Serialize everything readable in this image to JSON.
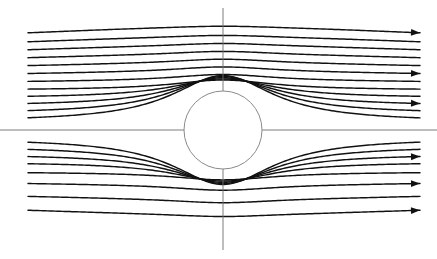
{
  "figure": {
    "kind": "streamline-diagram",
    "width": 437,
    "height": 259,
    "background_color": "#ffffff"
  },
  "colors": {
    "streamline": "#111111",
    "axis": "#6e6e6e",
    "cylinder_stroke": "#8a8a8a",
    "cylinder_fill": "#ffffff",
    "arrow": "#111111"
  },
  "cylinder": {
    "label": "cylinder",
    "center_x": 223,
    "center_y": 130,
    "radius": 39
  },
  "axes": {
    "vertical": {
      "label": "y-axis",
      "x": 223,
      "y_start": 8,
      "y_end": 250
    },
    "horizontal": {
      "label": "x-axis",
      "y": 130,
      "x_start": 0,
      "x_end": 437
    }
  },
  "flow": {
    "direction": "left-to-right",
    "inlet_x": 28,
    "outlet_x": 420,
    "streamline_count": 20
  },
  "chart_data": {
    "type": "line",
    "xlabel": "",
    "ylabel": "",
    "xlim": [
      0,
      437
    ],
    "ylim": [
      0,
      259
    ],
    "grid": false,
    "legend": "none",
    "cylinder": {
      "cx": 223,
      "cy": 130,
      "r": 39
    },
    "note": "psi values are signed offsets in pixels from the horizontal centerline at the far field; negative = above axis, positive = below axis",
    "series": [
      {
        "name": "streamline-01",
        "psi": -97,
        "inlet_y": 33,
        "outlet_y": 34,
        "arrow": true
      },
      {
        "name": "streamline-02",
        "psi": -88,
        "inlet_y": 42,
        "outlet_y": 43,
        "arrow": false
      },
      {
        "name": "streamline-03",
        "psi": -80,
        "inlet_y": 50,
        "outlet_y": 51,
        "arrow": false
      },
      {
        "name": "streamline-04",
        "psi": -72,
        "inlet_y": 58,
        "outlet_y": 59,
        "arrow": false
      },
      {
        "name": "streamline-05",
        "psi": -64,
        "inlet_y": 66,
        "outlet_y": 67,
        "arrow": false
      },
      {
        "name": "streamline-06",
        "psi": -56,
        "inlet_y": 74,
        "outlet_y": 75,
        "arrow": true
      },
      {
        "name": "streamline-07",
        "psi": -48,
        "inlet_y": 82,
        "outlet_y": 83,
        "arrow": false
      },
      {
        "name": "streamline-08",
        "psi": -40,
        "inlet_y": 90,
        "outlet_y": 91,
        "arrow": false
      },
      {
        "name": "streamline-09",
        "psi": -32,
        "inlet_y": 98,
        "outlet_y": 99,
        "arrow": false
      },
      {
        "name": "streamline-10",
        "psi": -24,
        "inlet_y": 106,
        "outlet_y": 107,
        "arrow": true
      },
      {
        "name": "streamline-11",
        "psi": -16,
        "inlet_y": 114,
        "outlet_y": 115,
        "arrow": false
      },
      {
        "name": "streamline-12",
        "psi": -8,
        "inlet_y": 122,
        "outlet_y": 123,
        "arrow": false
      },
      {
        "name": "streamline-13",
        "psi": 8,
        "inlet_y": 138,
        "outlet_y": 139,
        "arrow": false
      },
      {
        "name": "streamline-14",
        "psi": 16,
        "inlet_y": 146,
        "outlet_y": 147,
        "arrow": false
      },
      {
        "name": "streamline-15",
        "psi": 24,
        "inlet_y": 154,
        "outlet_y": 155,
        "arrow": true
      },
      {
        "name": "streamline-16",
        "psi": 32,
        "inlet_y": 162,
        "outlet_y": 163,
        "arrow": false
      },
      {
        "name": "streamline-17",
        "psi": 42,
        "inlet_y": 172,
        "outlet_y": 173,
        "arrow": false
      },
      {
        "name": "streamline-18",
        "psi": 53,
        "inlet_y": 183,
        "outlet_y": 184,
        "arrow": true
      },
      {
        "name": "streamline-19",
        "psi": 66,
        "inlet_y": 196,
        "outlet_y": 197,
        "arrow": false
      },
      {
        "name": "streamline-20",
        "psi": 80,
        "inlet_y": 210,
        "outlet_y": 211,
        "arrow": true
      }
    ]
  }
}
